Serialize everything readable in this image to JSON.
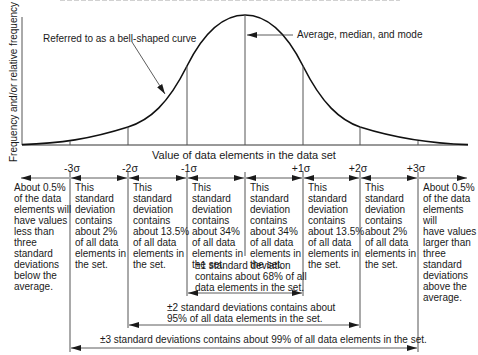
{
  "diagram": {
    "type": "normal-distribution",
    "y_axis_label": "Frequency and/or relative frequency",
    "x_axis_label": "Value of data elements in the data set",
    "callouts": {
      "curve": "Referred to as a bell-shaped curve",
      "center": "Average, median, and mode"
    },
    "sigma_labels": [
      "-3σ",
      "-2σ",
      "-1σ",
      "+1σ",
      "+2σ",
      "+3σ"
    ],
    "regions": [
      {
        "id": "below-3",
        "lines": [
          "About 0.5%",
          "of the data",
          "elements will",
          "have values",
          "less than",
          "three",
          "standard",
          "deviations",
          "below the",
          "average."
        ]
      },
      {
        "id": "minus3-minus2",
        "lines": [
          "This",
          "standard",
          "deviation",
          "contains",
          "about 2%",
          "of all data",
          "elements in",
          "the set."
        ]
      },
      {
        "id": "minus2-minus1",
        "lines": [
          "This",
          "standard",
          "deviation",
          "contains",
          "about 13.5%",
          "of all data",
          "elements in",
          "the set."
        ]
      },
      {
        "id": "minus1-mean",
        "lines": [
          "This",
          "standard",
          "deviation",
          "contains",
          "about 34%",
          "of all data",
          "elements in",
          "the set."
        ]
      },
      {
        "id": "mean-plus1",
        "lines": [
          "This",
          "standard",
          "deviation",
          "contains",
          "about 34%",
          "of all data",
          "elements in",
          "the set."
        ]
      },
      {
        "id": "plus1-plus2",
        "lines": [
          "This",
          "standard",
          "deviation",
          "contains",
          "about 13.5%",
          "of all data",
          "elements in",
          "the set."
        ]
      },
      {
        "id": "plus2-plus3",
        "lines": [
          "This",
          "standard",
          "deviation",
          "contains",
          "about 2%",
          "of all data",
          "elements in",
          "the set."
        ]
      },
      {
        "id": "above-3",
        "lines": [
          "About 0.5%",
          "of the data",
          "elements will",
          "have values",
          "larger than",
          "three",
          "standard",
          "deviations",
          "above the",
          "average."
        ]
      }
    ],
    "spans": {
      "one": [
        "±1 standard deviation",
        "contains about 68% of all",
        "data elements in the set."
      ],
      "two": [
        "±2 standard deviations contains about",
        "95% of all data elements in the set."
      ],
      "three": [
        "±3 standard deviations contains about 99% of all data elements in the set."
      ]
    }
  }
}
